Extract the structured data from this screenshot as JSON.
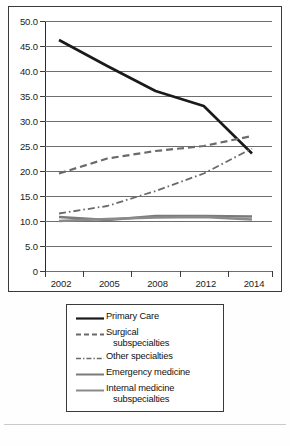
{
  "chart_data": {
    "type": "line",
    "title": "",
    "xlabel": "",
    "ylabel": "",
    "x": [
      2002,
      2005,
      2008,
      2012,
      2014
    ],
    "tick_labels": [
      "2002",
      "2005",
      "2008",
      "2012",
      "2014"
    ],
    "y_ticks": [
      "50.0",
      "45.0",
      "40.0",
      "35.0",
      "30.0",
      "25.0",
      "20.0",
      "15.0",
      "10.0",
      "5.0",
      "0"
    ],
    "y_tick_values": [
      50,
      45,
      40,
      35,
      30,
      25,
      20,
      15,
      10,
      5,
      0
    ],
    "ylim": [
      0,
      50
    ],
    "grid": true,
    "legend_position": "below",
    "series": [
      {
        "name": "Primary Care",
        "style": "solid",
        "color": "#1a1a1a",
        "width": 2.6,
        "values": [
          46.2,
          41.0,
          36.0,
          33.0,
          23.5
        ]
      },
      {
        "name": "Surgical subspecialties",
        "style": "dashed",
        "color": "#6a6a6a",
        "width": 2.2,
        "values": [
          19.5,
          22.5,
          24.0,
          25.0,
          27.0
        ]
      },
      {
        "name": "Other specialties",
        "style": "dash-dot",
        "color": "#6a6a6a",
        "width": 1.8,
        "values": [
          11.5,
          13.0,
          16.0,
          19.5,
          24.5
        ]
      },
      {
        "name": "Emergency medicine",
        "style": "solid",
        "color": "#7a7a7a",
        "width": 2.4,
        "values": [
          10.8,
          10.2,
          11.0,
          11.0,
          10.9
        ]
      },
      {
        "name": "Internal medicine subspecialties",
        "style": "solid",
        "color": "#8a8a8a",
        "width": 2.4,
        "values": [
          10.0,
          10.4,
          10.7,
          10.8,
          10.3
        ]
      }
    ]
  },
  "legend": {
    "entries": [
      {
        "label_line1": "Primary Care",
        "label_line2": ""
      },
      {
        "label_line1": "Surgical",
        "label_line2": "subspecialties"
      },
      {
        "label_line1": "Other specialties",
        "label_line2": ""
      },
      {
        "label_line1": "Emergency medicine",
        "label_line2": ""
      },
      {
        "label_line1": "Internal medicine",
        "label_line2": "subspecialties"
      }
    ]
  }
}
